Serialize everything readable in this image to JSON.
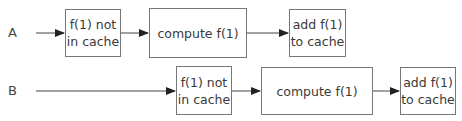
{
  "diagram": {
    "rows": [
      {
        "label": "A",
        "boxes": [
          {
            "text": "f(1) not\nin cache"
          },
          {
            "text": "compute f(1)"
          },
          {
            "text": "add f(1)\nto cache"
          }
        ]
      },
      {
        "label": "B",
        "boxes": [
          {
            "text": "f(1) not\nin cache"
          },
          {
            "text": "compute f(1)"
          },
          {
            "text": "add f(1)\nto cache"
          }
        ]
      }
    ],
    "colors": {
      "stroke": "#777777",
      "arrow": "#333333",
      "text": "#3a3a3a"
    }
  }
}
